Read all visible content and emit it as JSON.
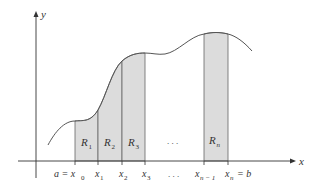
{
  "diagram": {
    "colors": {
      "fill": "#dcdcdc",
      "stroke": "#555555",
      "axis": "#333333"
    },
    "axes": {
      "x_label": "x",
      "y_label": "y"
    },
    "rectangles": [
      {
        "label": "R",
        "sub": "1"
      },
      {
        "label": "R",
        "sub": "2"
      },
      {
        "label": "R",
        "sub": "3"
      },
      {
        "label": "R",
        "sub": "n"
      }
    ],
    "ellipsis_middle": ". . .",
    "ellipsis_axis": ". . .",
    "ticks": {
      "a_eq": "a = x",
      "x0_sub": "0",
      "x1": "x",
      "x1_sub": "1",
      "x2": "x",
      "x2_sub": "2",
      "x3": "x",
      "x3_sub": "3",
      "xn1": "x",
      "xn1_sub": "n − 1",
      "xn": "x",
      "xn_sub": "n",
      "eq_b": "= b"
    }
  }
}
